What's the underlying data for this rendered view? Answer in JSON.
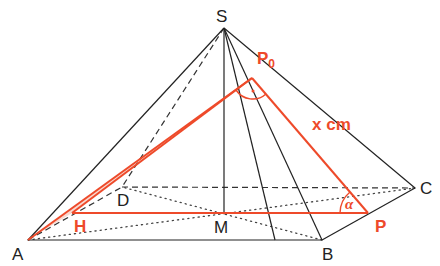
{
  "figure": {
    "colors": {
      "edges": "#222222",
      "highlight": "#ee4a2a",
      "highlight_fill": "#f8c9bc"
    },
    "points": {
      "S": "S",
      "A": "A",
      "B": "B",
      "C": "C",
      "D": "D",
      "M": "M",
      "H": "H",
      "P": "P",
      "P0": "P",
      "P0_subscript": "0"
    },
    "annotations": {
      "length_label": "x cm",
      "angle_label": "α",
      "right_angle_marker": "·"
    }
  }
}
